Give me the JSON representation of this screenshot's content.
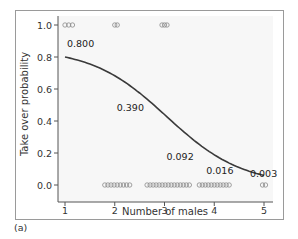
{
  "chart_data": {
    "type": "line",
    "title": "",
    "xlabel": "Number of males",
    "ylabel": "Take over probability",
    "panel_label": "(a)",
    "xlim": [
      1,
      5
    ],
    "ylim": [
      0.0,
      1.0
    ],
    "x_ticks": [
      "1",
      "2",
      "3",
      "4",
      "5"
    ],
    "y_ticks": [
      "0.0",
      "0.2",
      "0.4",
      "0.6",
      "0.8",
      "1.0"
    ],
    "grid": false,
    "series": [
      {
        "name": "fitted logistic curve",
        "x": [
          1,
          2,
          3,
          4,
          5
        ],
        "values": [
          0.8,
          0.39,
          0.092,
          0.016,
          0.003
        ]
      }
    ],
    "annotations": [
      {
        "x": 1,
        "text": "0.800"
      },
      {
        "x": 2,
        "text": "0.390"
      },
      {
        "x": 3,
        "text": "0.092"
      },
      {
        "x": 4,
        "text": "0.016"
      },
      {
        "x": 5,
        "text": "0.003"
      }
    ],
    "observations": {
      "y1": [
        {
          "x_from": 1.0,
          "x_to": 1.15
        },
        {
          "x_from": 2.0,
          "x_to": 2.05
        },
        {
          "x_from": 2.95,
          "x_to": 3.05
        }
      ],
      "y0": [
        {
          "x_from": 1.8,
          "x_to": 2.3
        },
        {
          "x_from": 2.65,
          "x_to": 3.5
        },
        {
          "x_from": 3.7,
          "x_to": 4.3
        },
        {
          "x_from": 4.97,
          "x_to": 5.03
        }
      ]
    },
    "colors": {
      "plot_background": "#f7f7f7",
      "curve": "#3a3a3a",
      "axis": "#555555",
      "marker": "#8a8a8a"
    }
  }
}
